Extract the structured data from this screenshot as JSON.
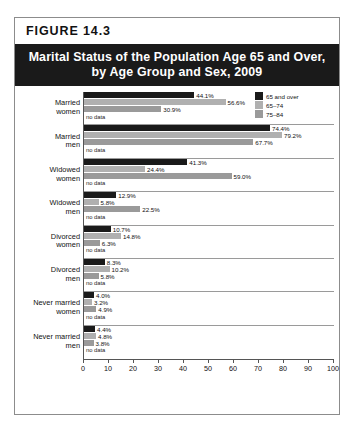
{
  "figure": {
    "header": "FIGURE  14.3",
    "title_line1": "Marital Status of the Population Age 65 and Over,",
    "title_line2": "by Age Group and Sex, 2009"
  },
  "legend": {
    "items": [
      {
        "label": "65 and over",
        "color": "#1a1a1a"
      },
      {
        "label": "65–74",
        "color": "#b0b0b0"
      },
      {
        "label": "75–84",
        "color": "#9a9a9a"
      }
    ]
  },
  "axis": {
    "ticks": [
      "0",
      "10",
      "20",
      "30",
      "40",
      "50",
      "60",
      "70",
      "80",
      "90",
      "100"
    ],
    "min": 0,
    "max": 100
  },
  "nodata_label": "no data",
  "chart_data": {
    "type": "bar",
    "orientation": "horizontal",
    "title": "Marital Status of the Population Age 65 and Over, by Age Group and Sex, 2009",
    "xlabel": "",
    "ylabel": "",
    "xlim": [
      0,
      100
    ],
    "grid": false,
    "legend_position": "top-right",
    "series_names": [
      "65 and over",
      "65–74",
      "75–84"
    ],
    "categories": [
      "Married\nwomen",
      "Married\nmen",
      "Widowed\nwomen",
      "Widowed\nmen",
      "Divorced\nwomen",
      "Divorced\nmen",
      "Never married\nwomen",
      "Never married\nmen"
    ],
    "series": [
      {
        "name": "65 and over",
        "values": [
          44.1,
          74.4,
          41.3,
          12.9,
          10.7,
          8.3,
          4.0,
          4.4
        ]
      },
      {
        "name": "65–74",
        "values": [
          56.6,
          79.2,
          24.4,
          5.8,
          14.8,
          10.2,
          3.2,
          4.8
        ]
      },
      {
        "name": "75–84",
        "values": [
          30.9,
          67.7,
          59.0,
          22.5,
          6.3,
          5.8,
          4.9,
          3.8
        ]
      }
    ],
    "value_labels": [
      [
        "44.1%",
        "56.6%",
        "30.9%"
      ],
      [
        "74.4%",
        "79.2%",
        "67.7%"
      ],
      [
        "41.3%",
        "24.4%",
        "59.0%"
      ],
      [
        "12.9%",
        "5.8%",
        "22.5%"
      ],
      [
        "10.7%",
        "14.8%",
        "6.3%"
      ],
      [
        "8.3%",
        "10.2%",
        "5.8%"
      ],
      [
        "4.0%",
        "3.2%",
        "4.9%"
      ],
      [
        "4.4%",
        "4.8%",
        "3.8%"
      ]
    ]
  }
}
